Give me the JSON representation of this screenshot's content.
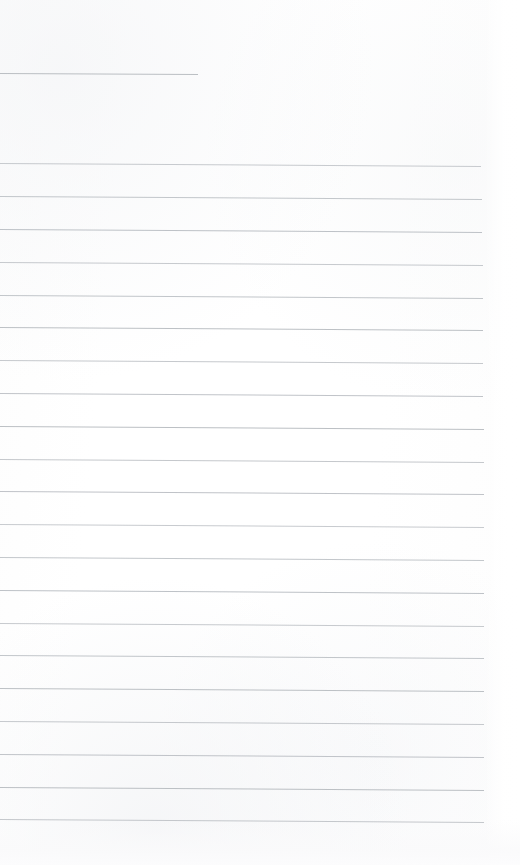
{
  "page": {
    "kind": "scanned-ruled-notepad-page",
    "width": 520,
    "height": 865,
    "background_color": "#fefefe",
    "text_content": "",
    "has_handwriting": false,
    "has_printed_text": false
  },
  "colors": {
    "paper": "#fefefe",
    "rule_line": "#b9bdc2",
    "header_rule_line": "#b4b8bd"
  },
  "header_rule": {
    "label": "header-rule",
    "y": 73,
    "x_start": 0,
    "x_end": 198,
    "thickness": 1
  },
  "ruling": {
    "line_count": 21,
    "first_line_y": 163,
    "last_line_y": 819,
    "spacing": 32.8,
    "x_start": 0,
    "x_end": 483,
    "thickness": 1,
    "tilt_degrees": 0.35,
    "lines": [
      {
        "y": 163,
        "x_end": 481
      },
      {
        "y": 196,
        "x_end": 482
      },
      {
        "y": 229,
        "x_end": 482
      },
      {
        "y": 262,
        "x_end": 483
      },
      {
        "y": 295,
        "x_end": 483
      },
      {
        "y": 327,
        "x_end": 483
      },
      {
        "y": 360,
        "x_end": 483
      },
      {
        "y": 393,
        "x_end": 483
      },
      {
        "y": 426,
        "x_end": 484
      },
      {
        "y": 459,
        "x_end": 484
      },
      {
        "y": 491,
        "x_end": 484
      },
      {
        "y": 524,
        "x_end": 484
      },
      {
        "y": 557,
        "x_end": 484
      },
      {
        "y": 590,
        "x_end": 484
      },
      {
        "y": 623,
        "x_end": 484
      },
      {
        "y": 655,
        "x_end": 484
      },
      {
        "y": 688,
        "x_end": 484
      },
      {
        "y": 721,
        "x_end": 484
      },
      {
        "y": 754,
        "x_end": 484
      },
      {
        "y": 787,
        "x_end": 484
      },
      {
        "y": 819,
        "x_end": 484
      }
    ]
  }
}
